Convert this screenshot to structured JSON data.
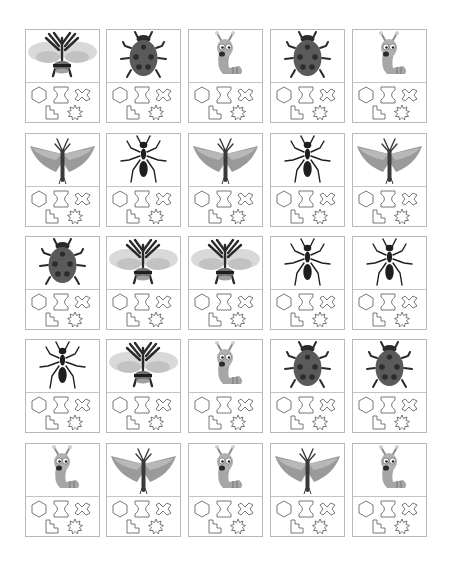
{
  "worksheet": {
    "columns": 5,
    "rows": 5,
    "shape_set": [
      "hexagon",
      "hourglass",
      "cross",
      "staircase",
      "starburst"
    ],
    "colors": {
      "card_border": "#b9b9b9",
      "shape_stroke": "#6a6a6a",
      "ladybug_body": "#5a5a5a",
      "ladybug_spots": "#2c2c2c",
      "insect_dark": "#2a2a2a",
      "wing_light": "#d6d6d6",
      "wing_mid": "#9a9a9a",
      "worm_body": "#a6a6a6"
    },
    "cards": [
      {
        "row": 1,
        "col": 1,
        "insect": "bee"
      },
      {
        "row": 1,
        "col": 2,
        "insect": "ladybug"
      },
      {
        "row": 1,
        "col": 3,
        "insect": "worm"
      },
      {
        "row": 1,
        "col": 4,
        "insect": "ladybug"
      },
      {
        "row": 1,
        "col": 5,
        "insect": "worm"
      },
      {
        "row": 2,
        "col": 1,
        "insect": "moth"
      },
      {
        "row": 2,
        "col": 2,
        "insect": "ant"
      },
      {
        "row": 2,
        "col": 3,
        "insect": "moth"
      },
      {
        "row": 2,
        "col": 4,
        "insect": "ant"
      },
      {
        "row": 2,
        "col": 5,
        "insect": "moth"
      },
      {
        "row": 3,
        "col": 1,
        "insect": "ladybug"
      },
      {
        "row": 3,
        "col": 2,
        "insect": "bee"
      },
      {
        "row": 3,
        "col": 3,
        "insect": "bee"
      },
      {
        "row": 3,
        "col": 4,
        "insect": "ant"
      },
      {
        "row": 3,
        "col": 5,
        "insect": "ant"
      },
      {
        "row": 4,
        "col": 1,
        "insect": "ant"
      },
      {
        "row": 4,
        "col": 2,
        "insect": "bee"
      },
      {
        "row": 4,
        "col": 3,
        "insect": "worm"
      },
      {
        "row": 4,
        "col": 4,
        "insect": "ladybug"
      },
      {
        "row": 4,
        "col": 5,
        "insect": "ladybug"
      },
      {
        "row": 5,
        "col": 1,
        "insect": "worm"
      },
      {
        "row": 5,
        "col": 2,
        "insect": "moth"
      },
      {
        "row": 5,
        "col": 3,
        "insect": "worm"
      },
      {
        "row": 5,
        "col": 4,
        "insect": "moth"
      },
      {
        "row": 5,
        "col": 5,
        "insect": "worm"
      }
    ]
  }
}
